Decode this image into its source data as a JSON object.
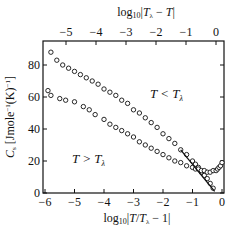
{
  "chart_data": {
    "type": "scatter",
    "title": "",
    "xlabel": "log10|T/Tλ − 1|",
    "x2label": "log10|Tλ − T|",
    "ylabel": "C, [Jmole⁻¹(K)⁻¹]",
    "xlim": [
      -6,
      0
    ],
    "x2lim": [
      -5.7,
      0.2
    ],
    "ylim": [
      0,
      96
    ],
    "xticks": [
      "-6",
      "-5",
      "-4",
      "-3",
      "-2",
      "-1",
      "0"
    ],
    "x2ticks": [
      "-5",
      "-4",
      "-3",
      "-2",
      "-1",
      "0"
    ],
    "yticks": [
      "0",
      "20",
      "40",
      "60",
      "80"
    ],
    "grid": false,
    "annotations": [
      {
        "text": "T < Tλ",
        "x": -1.5,
        "y": 70
      },
      {
        "text": "T > Tλ",
        "x": -4.5,
        "y": 20
      }
    ],
    "series": [
      {
        "name": "T < Tλ",
        "x": [
          -5.8,
          -5.6,
          -5.4,
          -5.2,
          -5.0,
          -4.8,
          -4.6,
          -4.4,
          -4.2,
          -4.0,
          -3.8,
          -3.6,
          -3.4,
          -3.2,
          -3.0,
          -2.8,
          -2.6,
          -2.4,
          -2.2,
          -2.0,
          -1.8,
          -1.6,
          -1.4,
          -1.2,
          -1.0,
          -0.9,
          -0.8,
          -0.7,
          -0.6,
          -0.5,
          -0.4,
          -0.3
        ],
        "values": [
          88,
          83,
          80,
          78,
          76,
          74,
          72,
          70,
          68,
          65,
          63,
          61,
          58,
          56,
          52,
          50,
          47,
          44,
          41,
          37,
          34,
          31,
          27,
          24,
          20,
          18,
          16,
          13,
          11,
          9,
          6,
          3
        ]
      },
      {
        "name": "T > Tλ",
        "x": [
          -5.9,
          -5.8,
          -5.5,
          -5.3,
          -5.0,
          -4.7,
          -4.5,
          -4.3,
          -4.0,
          -3.8,
          -3.6,
          -3.4,
          -3.2,
          -3.0,
          -2.8,
          -2.6,
          -2.4,
          -2.2,
          -2.0,
          -1.8,
          -1.6,
          -1.4,
          -1.2,
          -1.0,
          -0.9,
          -0.8,
          -0.7,
          -0.6,
          -0.5,
          -0.4,
          -0.3,
          -0.2,
          -0.15,
          -0.1,
          -0.05,
          0.0
        ],
        "values": [
          64,
          61,
          59,
          58,
          57,
          54,
          52,
          49,
          46,
          43,
          41,
          39,
          37,
          35,
          32,
          30,
          28,
          26,
          24,
          22,
          20,
          19,
          17,
          16,
          15,
          15,
          14,
          14,
          13,
          13,
          14,
          14,
          15,
          16,
          17,
          19
        ]
      }
    ]
  }
}
